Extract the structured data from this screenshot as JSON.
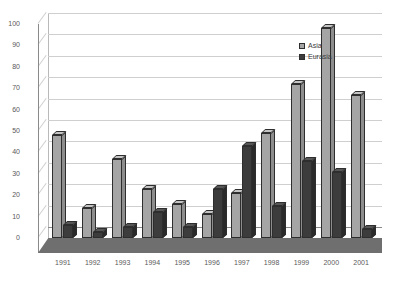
{
  "chart_data": {
    "type": "bar",
    "title": "",
    "subtitle": "",
    "xlabel": "",
    "ylabel": "",
    "ylim": [
      0,
      100
    ],
    "ytick_step": 10,
    "yticks": [
      0,
      10,
      20,
      30,
      40,
      50,
      60,
      70,
      80,
      90,
      100
    ],
    "grid": true,
    "legend_position": "top-right-inside",
    "categories": [
      "1991",
      "1992",
      "1993",
      "1994",
      "1995",
      "1996",
      "1997",
      "1998",
      "1999",
      "2000",
      "2001"
    ],
    "series": [
      {
        "name": "Asia",
        "color": "#a5a5a5",
        "values": [
          48,
          14,
          37,
          23,
          16,
          11,
          21,
          49,
          72,
          98,
          67
        ]
      },
      {
        "name": "Eurasia",
        "color": "#3c3c3c",
        "values": [
          6,
          3,
          5,
          12,
          5,
          23,
          43,
          15,
          36,
          31,
          4
        ]
      }
    ]
  },
  "legend": {
    "items": [
      {
        "label": "Asia",
        "swatch": "asia"
      },
      {
        "label": "Eurasia",
        "swatch": "eurasia"
      }
    ]
  },
  "colors": {
    "asia": "#a5a5a5",
    "eurasia": "#3c3c3c",
    "gridline": "#cfcfcf",
    "axis": "#8a8a8a",
    "floor": "#6f6f6f",
    "tick_text": "#5a5a5a"
  }
}
